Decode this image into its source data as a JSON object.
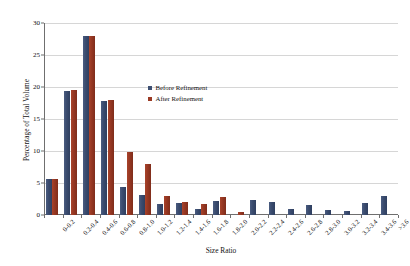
{
  "chart_data": {
    "type": "bar",
    "title": "",
    "subtitle": "",
    "xlabel": "Size Ratio",
    "ylabel": "Percentage of Total Volume",
    "ylim": [
      0,
      30
    ],
    "yticks": [
      0,
      5,
      10,
      15,
      20,
      25,
      30
    ],
    "ytick_labels": [
      "0",
      "5",
      "10",
      "15",
      "20",
      "25",
      "30"
    ],
    "grid": "horizontal",
    "legend_position": "inside-upper-left",
    "categories": [
      "0-0.2",
      "0.2-0.4",
      "0.4-0.6",
      "0.6-0.8",
      "0.8-1.0",
      "1.0-1.2",
      "1.2-1.4",
      "1.4-1.6",
      "1.6-1.8",
      "1.8-2.0",
      "2.0-2.2",
      "2.2-2.4",
      "2.4-2.6",
      "2.6-2.8",
      "2.8-3.0",
      "3.0-3.2",
      "3.2-3.4",
      "3.4-3.6",
      ">3.6"
    ],
    "series": [
      {
        "name": "Before Refinement",
        "color": "#3d4f72",
        "values": [
          5.7,
          19.3,
          28.0,
          17.8,
          4.4,
          3.1,
          1.7,
          1.9,
          0.9,
          2.2,
          0.0,
          2.3,
          2.1,
          1.0,
          1.6,
          0.8,
          0.7,
          1.9,
          3.0
        ]
      },
      {
        "name": "After Refinement",
        "color": "#9a3a24",
        "values": [
          5.7,
          19.5,
          28.0,
          18.0,
          9.9,
          7.9,
          3.0,
          2.1,
          1.7,
          2.8,
          0.4,
          0.0,
          0.0,
          0.0,
          0.0,
          0.0,
          0.0,
          0.0,
          0.0
        ]
      }
    ]
  },
  "legend": {
    "items": [
      {
        "label": "Before Refinement"
      },
      {
        "label": "After Refinement"
      }
    ]
  },
  "axes": {
    "y_title": "Percentage of Total Volume",
    "x_title": "Size Ratio"
  }
}
